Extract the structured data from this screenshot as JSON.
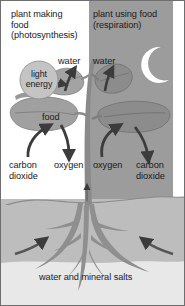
{
  "diagram": {
    "title_left": "plant making\nfood\n(photosynthesis)",
    "title_right": "plant using food\n(respiration)",
    "labels": {
      "water_left": "water",
      "water_right": "water",
      "light_energy": "light\nenergy",
      "food": "food",
      "carbon_dioxide_left": "carbon\ndioxide",
      "oxygen_left": "oxygen",
      "oxygen_right": "oxygen",
      "carbon_dioxide_right": "carbon\ndioxide",
      "water_and_mineral_salts": "water and mineral salts"
    },
    "icons": {
      "moon": "crescent-moon-icon",
      "light_energy_circle": "light-energy-circle-icon"
    },
    "colors": {
      "panel_left_bg": "#ffffff",
      "panel_right_bg": "#9c9c9c",
      "soil": "#bdbdbd",
      "soil_lower": "#e8e8e8",
      "plant": "#8f8f8f",
      "plant_right": "#7e7e7e",
      "arrow": "#3c3c3c",
      "moon": "#ffffff",
      "text": "#1a1a1a",
      "border": "#6e6e6e"
    }
  }
}
